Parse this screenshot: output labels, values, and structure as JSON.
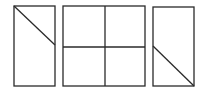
{
  "diagram": {
    "stroke_color": "#2a2a2a",
    "background": "#ffffff",
    "figures": [
      {
        "id": "figure-1",
        "type": "rectangle-with-diagonal",
        "rect": {
          "x": 14,
          "y": 6,
          "w": 41,
          "h": 80
        },
        "diagonal": {
          "x1": 14,
          "y1": 6,
          "x2": 55,
          "y2": 45
        }
      },
      {
        "id": "figure-2",
        "type": "rectangle-quartered",
        "rect": {
          "x": 63,
          "y": 6,
          "w": 82,
          "h": 80
        },
        "vertical_divider_x": 105,
        "horizontal_divider_y": 47
      },
      {
        "id": "figure-3",
        "type": "rectangle-with-diagonal",
        "rect": {
          "x": 153,
          "y": 7,
          "w": 41,
          "h": 79
        },
        "diagonal": {
          "x1": 153,
          "y1": 46,
          "x2": 194,
          "y2": 86
        }
      }
    ]
  }
}
